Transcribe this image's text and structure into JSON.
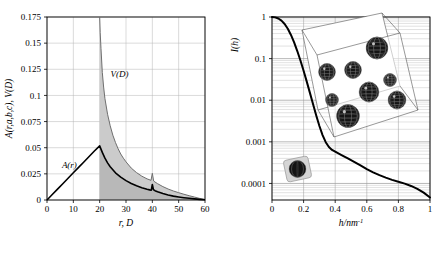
{
  "figure": {
    "background_color": "#ffffff",
    "panel_count": 2
  },
  "chart_data": [
    {
      "id": "left-panel",
      "type": "line",
      "title": "",
      "xlabel": "r,  D",
      "ylabel": "A(r,a,b,c),  V(D)",
      "xlim": [
        0,
        60
      ],
      "ylim": [
        0,
        0.175
      ],
      "grid": true,
      "xticks": [
        0,
        10,
        20,
        30,
        40,
        50,
        60
      ],
      "xticklabels": [
        "0",
        "10",
        "20",
        "30",
        "40",
        "50",
        "60"
      ],
      "yticks": [
        0,
        0.025,
        0.05,
        0.075,
        0.1,
        0.125,
        0.15,
        0.175
      ],
      "yticklabels": [
        "0",
        "0.025",
        "0.05",
        "0.075",
        "0.1",
        "0.125",
        "0.15",
        "0.175"
      ],
      "shaded_region": {
        "label": "shaded-area-between-curves",
        "color": "#c9c9c9",
        "x_start": 20,
        "x_end": 60
      },
      "annotations": [
        {
          "text": "V(D)",
          "x": 27.5,
          "y": 0.118
        },
        {
          "text": "A(r)",
          "x": 8.5,
          "y": 0.031
        }
      ],
      "series": [
        {
          "name": "A(r)",
          "color": "#000000",
          "linewidth": 1.6,
          "x": [
            0,
            2,
            4,
            6,
            8,
            10,
            12,
            14,
            16,
            18,
            20,
            21,
            22,
            23,
            24,
            26,
            28,
            30,
            32,
            34,
            36,
            38,
            39,
            39.6,
            40,
            40.4,
            41,
            42,
            44,
            46,
            48,
            50,
            52,
            54,
            56,
            58,
            60
          ],
          "y": [
            0,
            0.0052,
            0.0104,
            0.0156,
            0.0208,
            0.026,
            0.0312,
            0.0364,
            0.0416,
            0.0468,
            0.0518,
            0.0455,
            0.04,
            0.0355,
            0.0318,
            0.026,
            0.0218,
            0.0185,
            0.0158,
            0.0136,
            0.0118,
            0.0103,
            0.0097,
            0.0094,
            0.0148,
            0.01,
            0.0089,
            0.0079,
            0.0062,
            0.0048,
            0.0037,
            0.0029,
            0.0022,
            0.0016,
            0.0011,
            0.0006,
            0.0002
          ]
        },
        {
          "name": "V(D)",
          "color": "#6f6f6f",
          "linewidth": 1.0,
          "x": [
            20,
            20.2,
            20.5,
            21,
            21.5,
            22,
            23,
            24,
            25,
            26,
            27,
            28,
            29,
            30,
            32,
            34,
            36,
            38,
            39.5,
            40,
            40.5,
            41,
            42,
            44,
            46,
            48,
            50,
            52,
            54,
            56,
            58,
            60
          ],
          "y": [
            0.175,
            0.16,
            0.145,
            0.122,
            0.108,
            0.097,
            0.082,
            0.071,
            0.062,
            0.055,
            0.049,
            0.044,
            0.04,
            0.0365,
            0.0305,
            0.0262,
            0.0228,
            0.0202,
            0.0188,
            0.0255,
            0.0182,
            0.0172,
            0.0156,
            0.0128,
            0.0105,
            0.0086,
            0.007,
            0.0055,
            0.0041,
            0.0028,
            0.0015,
            0.0004
          ]
        }
      ]
    },
    {
      "id": "right-panel",
      "type": "line",
      "title": "",
      "xlabel": "h/nm",
      "xlabel_exponent": "-1",
      "ylabel": "I(h)",
      "xlim": [
        0,
        1
      ],
      "ylim": [
        4e-05,
        1
      ],
      "yscale": "log",
      "grid": true,
      "xticks": [
        0,
        0.2,
        0.4,
        0.6,
        0.8,
        1
      ],
      "xticklabels": [
        "0",
        "0.2",
        "0.4",
        "0.6",
        "0.8",
        "1"
      ],
      "yticks": [
        1,
        0.1,
        0.01,
        0.001,
        0.0001
      ],
      "yticklabels": [
        "1",
        "0.1",
        "0.01",
        "0.001",
        "0.0001"
      ],
      "series": [
        {
          "name": "I(h)",
          "color": "#000000",
          "linewidth": 2.0,
          "x": [
            0,
            0.02,
            0.04,
            0.06,
            0.08,
            0.1,
            0.12,
            0.14,
            0.16,
            0.18,
            0.2,
            0.22,
            0.24,
            0.26,
            0.28,
            0.3,
            0.32,
            0.34,
            0.36,
            0.38,
            0.4,
            0.44,
            0.48,
            0.52,
            0.56,
            0.6,
            0.64,
            0.68,
            0.72,
            0.76,
            0.8,
            0.84,
            0.88,
            0.92,
            0.96,
            1.0
          ],
          "y": [
            1.0,
            0.98,
            0.92,
            0.82,
            0.68,
            0.52,
            0.37,
            0.245,
            0.152,
            0.09,
            0.051,
            0.028,
            0.015,
            0.008,
            0.0043,
            0.0024,
            0.00145,
            0.00098,
            0.00075,
            0.00064,
            0.00058,
            0.00048,
            0.0004,
            0.00033,
            0.00027,
            0.00022,
            0.000185,
            0.000158,
            0.000138,
            0.000122,
            0.00011,
            9.9e-05,
            8.7e-05,
            7.4e-05,
            6e-05,
            4.6e-05
          ]
        }
      ],
      "insets": [
        {
          "name": "particle-cluster-inset",
          "description": "wireframe parallelepiped containing dark textured spheres",
          "sphere_count": 8,
          "edge_color": "#333333",
          "sphere_color": "#1a1a1a"
        },
        {
          "name": "single-particle-inset",
          "description": "single dark sphere inside a small light rounded box",
          "sphere_count": 1,
          "box_color": "#d8d8d8",
          "sphere_color": "#1a1a1a"
        }
      ]
    }
  ]
}
